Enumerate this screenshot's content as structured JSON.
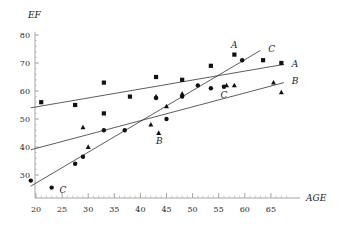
{
  "chart_data": {
    "type": "scatter",
    "title": "",
    "xlabel": "AGE",
    "ylabel": "EF",
    "xlim": [
      17,
      70
    ],
    "ylim": [
      24,
      82
    ],
    "xticks": [
      20,
      25,
      30,
      35,
      40,
      45,
      50,
      55,
      60,
      65
    ],
    "yticks": [
      30,
      40,
      50,
      60,
      70,
      80
    ],
    "grid": false,
    "legend_position": "line-end-right",
    "series": [
      {
        "name": "A",
        "marker": "square",
        "color": "#111111",
        "points": [
          {
            "x": 21.0,
            "y": 56.0
          },
          {
            "x": 27.5,
            "y": 55.0
          },
          {
            "x": 33.0,
            "y": 63.0
          },
          {
            "x": 33.0,
            "y": 52.0
          },
          {
            "x": 38.0,
            "y": 58.0
          },
          {
            "x": 43.0,
            "y": 65.0
          },
          {
            "x": 48.0,
            "y": 64.0
          },
          {
            "x": 53.5,
            "y": 69.0
          },
          {
            "x": 58.0,
            "y": 73.0
          },
          {
            "x": 63.5,
            "y": 71.0
          },
          {
            "x": 67.0,
            "y": 70.0
          }
        ],
        "fit_line": {
          "x0": 19.0,
          "y0": 54.0,
          "x1": 67.5,
          "y1": 69.5
        },
        "label": "A",
        "label_at": {
          "x": 69.0,
          "y": 69.5
        }
      },
      {
        "name": "B",
        "marker": "triangle",
        "color": "#111111",
        "points": [
          {
            "x": 29.0,
            "y": 47.0
          },
          {
            "x": 30.0,
            "y": 40.0
          },
          {
            "x": 42.0,
            "y": 48.0
          },
          {
            "x": 43.0,
            "y": 58.0
          },
          {
            "x": 43.5,
            "y": 45.0
          },
          {
            "x": 45.0,
            "y": 54.5
          },
          {
            "x": 48.0,
            "y": 59.0
          },
          {
            "x": 56.5,
            "y": 62.0
          },
          {
            "x": 58.0,
            "y": 62.0
          },
          {
            "x": 65.5,
            "y": 63.0
          },
          {
            "x": 67.0,
            "y": 59.5
          }
        ],
        "fit_line": {
          "x0": 19.0,
          "y0": 39.0,
          "x1": 67.5,
          "y1": 63.0
        },
        "label": "B",
        "label_at": {
          "x": 69.0,
          "y": 63.5
        },
        "label_inner": "B",
        "label_inner_at": {
          "x": 43.0,
          "y": 42.0
        }
      },
      {
        "name": "C",
        "marker": "circle",
        "color": "#111111",
        "points": [
          {
            "x": 19.0,
            "y": 28.0
          },
          {
            "x": 23.0,
            "y": 25.5
          },
          {
            "x": 27.5,
            "y": 34.0
          },
          {
            "x": 29.0,
            "y": 36.5
          },
          {
            "x": 33.0,
            "y": 46.0
          },
          {
            "x": 37.0,
            "y": 46.0
          },
          {
            "x": 43.0,
            "y": 57.5
          },
          {
            "x": 45.0,
            "y": 50.0
          },
          {
            "x": 48.0,
            "y": 58.0
          },
          {
            "x": 51.0,
            "y": 62.0
          },
          {
            "x": 53.5,
            "y": 61.0
          },
          {
            "x": 56.0,
            "y": 61.5
          },
          {
            "x": 59.5,
            "y": 71.0
          }
        ],
        "fit_line": {
          "x0": 19.0,
          "y0": 26.0,
          "x1": 63.0,
          "y1": 74.5
        },
        "label": "C",
        "label_at": {
          "x": 64.5,
          "y": 75.0
        },
        "label_inner": "C",
        "label_inner_at": {
          "x": 24.5,
          "y": 24.5
        }
      }
    ],
    "annotations": [
      {
        "text": "A",
        "x": 58.0,
        "y": 76.5
      },
      {
        "text": "C",
        "x": 56.0,
        "y": 58.5
      }
    ]
  },
  "axes": {
    "y_title": "EF",
    "x_title": "AGE"
  }
}
